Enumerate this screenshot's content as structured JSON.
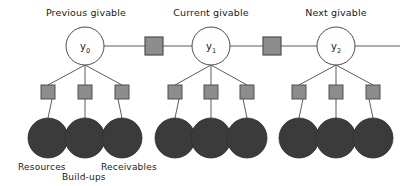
{
  "diagram": {
    "title_visible": false,
    "canvas": {
      "width": 414,
      "height": 186,
      "background": "#ffffff"
    },
    "colors": {
      "leaf_fill": "#3b3b3b",
      "square_fill": "#8d8d8d",
      "square_stroke": "#4f4f4f",
      "line": "#5c5c5c",
      "circle_fill": "#ffffff",
      "circle_stroke": "#4a4a4a",
      "text": "#1a1a1a"
    },
    "groups": [
      {
        "id": "previous",
        "title": "Previous givable",
        "title_x": 86,
        "title_y": 16,
        "node_label": "y",
        "node_subscript": "0",
        "node_x": 85,
        "node_y": 46,
        "node_r": 19,
        "squares_y": 92,
        "leaves_y": 138,
        "children_x": [
          48,
          85,
          122
        ]
      },
      {
        "id": "current",
        "title": "Current givable",
        "title_x": 211,
        "title_y": 16,
        "node_label": "y",
        "node_subscript": "1",
        "node_x": 211,
        "node_y": 46,
        "node_r": 19,
        "squares_y": 92,
        "leaves_y": 138,
        "children_x": [
          175,
          211,
          247
        ]
      },
      {
        "id": "next",
        "title": "Next givable",
        "title_x": 336,
        "title_y": 16,
        "node_label": "y",
        "node_subscript": "2",
        "node_x": 336,
        "node_y": 46,
        "node_r": 19,
        "squares_y": 92,
        "leaves_y": 138,
        "children_x": [
          299,
          336,
          373
        ]
      }
    ],
    "chain": {
      "y": 46,
      "start_x": 104,
      "end_x": 400,
      "link_squares": [
        {
          "id": "link-0-1",
          "x": 154,
          "y": 46,
          "size": 18
        },
        {
          "id": "link-1-2",
          "x": 272,
          "y": 46,
          "size": 18
        }
      ]
    },
    "leaf_captions": [
      {
        "id": "resources",
        "text": "Resources",
        "x": 18,
        "y": 170
      },
      {
        "id": "build-ups",
        "text": "Build-ups",
        "x": 62,
        "y": 180
      },
      {
        "id": "receivables",
        "text": "Receivables",
        "x": 101,
        "y": 170
      }
    ],
    "square_size": 14,
    "leaf_radius": 20
  }
}
